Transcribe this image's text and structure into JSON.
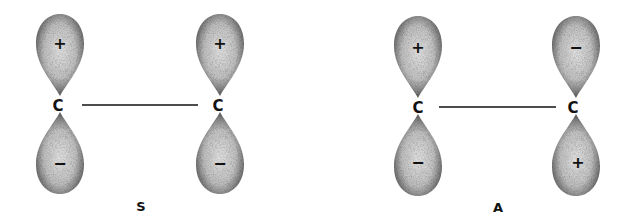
{
  "diagram": {
    "panels": [
      {
        "label": "S",
        "atoms": [
          {
            "symbol": "C",
            "top_lobe_sign": "+",
            "bottom_lobe_sign": "−"
          },
          {
            "symbol": "C",
            "top_lobe_sign": "+",
            "bottom_lobe_sign": "−"
          }
        ]
      },
      {
        "label": "A",
        "atoms": [
          {
            "symbol": "C",
            "top_lobe_sign": "+",
            "bottom_lobe_sign": "−"
          },
          {
            "symbol": "C",
            "top_lobe_sign": "−",
            "bottom_lobe_sign": "+"
          }
        ]
      }
    ],
    "colors": {
      "lobe_dark": "#3a3a3a",
      "lobe_light": "#e6e6e6",
      "line": "#111111"
    }
  }
}
